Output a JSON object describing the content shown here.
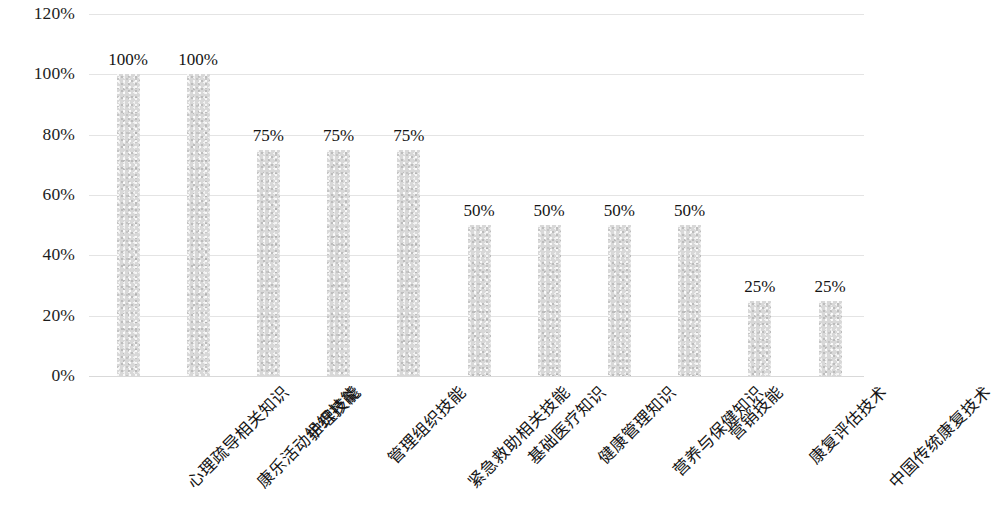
{
  "chart_data": {
    "type": "bar",
    "title": "",
    "subtitle": "",
    "xlabel": "",
    "ylabel": "",
    "ylim": [
      0,
      120
    ],
    "y_ticks": [
      "0%",
      "20%",
      "40%",
      "60%",
      "80%",
      "100%",
      "120%"
    ],
    "y_tick_values": [
      0,
      20,
      40,
      60,
      80,
      100,
      120
    ],
    "grid": true,
    "legend": false,
    "legend_position": "none",
    "bar_color": "#d8d8d8",
    "gridline_color": "#dfdfdf",
    "text_color": "#141414",
    "categories": [
      "心理疏导相关知识",
      "康乐活动组织技能",
      "护理技能",
      "管理组织技能",
      "紧急救助相关技能",
      "基础医疗知识",
      "健康管理知识",
      "营养与保健知识",
      "营销技能",
      "康复评估技术",
      "中国传统康复技术"
    ],
    "values": [
      100,
      100,
      75,
      75,
      75,
      50,
      50,
      50,
      50,
      25,
      25
    ],
    "data_labels": [
      "100%",
      "100%",
      "75%",
      "75%",
      "75%",
      "50%",
      "50%",
      "50%",
      "50%",
      "25%",
      "25%"
    ]
  }
}
